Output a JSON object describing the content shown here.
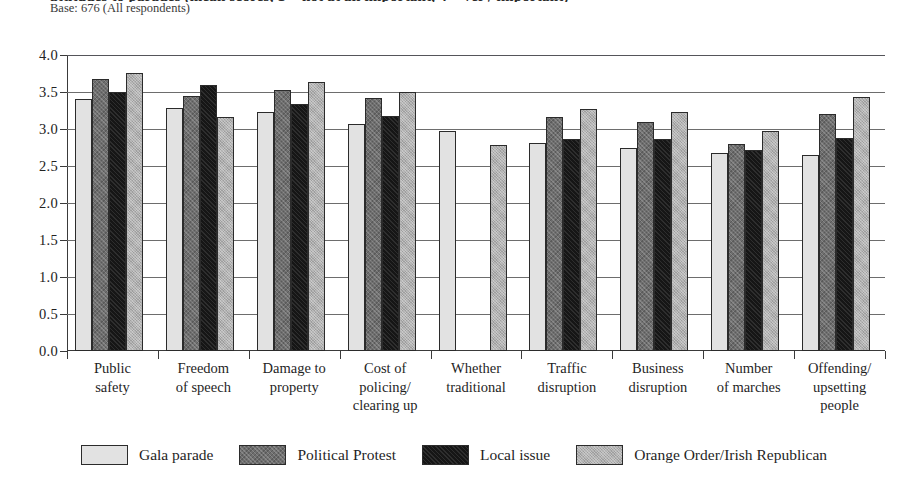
{
  "header": {
    "title_clipped": "attitudes to parades (mean scores, 1 = not at all important, 4 = very important)",
    "base_note": "Base: 676 (All respondents)"
  },
  "chart_data": {
    "type": "bar",
    "title": "",
    "xlabel": "",
    "ylabel": "",
    "ylim": [
      0.0,
      4.0
    ],
    "ytick_labels": [
      "4.0",
      "3.5",
      "3.0",
      "2.5",
      "2.0",
      "1.5",
      "1.0",
      "0.5",
      "0.0"
    ],
    "ytick_values": [
      4.0,
      3.5,
      3.0,
      2.5,
      2.0,
      1.5,
      1.0,
      0.5,
      0.0
    ],
    "grid": true,
    "legend_position": "bottom",
    "categories": [
      "Public safety",
      "Freedom of speech",
      "Damage to property",
      "Cost of policing/ clearing up",
      "Whether traditional",
      "Traffic disruption",
      "Business disruption",
      "Number of marches",
      "Offending/ upsetting people"
    ],
    "category_lines": [
      [
        "Public",
        "safety"
      ],
      [
        "Freedom",
        "of speech"
      ],
      [
        "Damage to",
        "property"
      ],
      [
        "Cost of",
        "policing/",
        "clearing up"
      ],
      [
        "Whether",
        "traditional"
      ],
      [
        "Traffic",
        "disruption"
      ],
      [
        "Business",
        "disruption"
      ],
      [
        "Number",
        "of marches"
      ],
      [
        "Offending/",
        "upsetting",
        "people"
      ]
    ],
    "series": [
      {
        "name": "Gala parade",
        "color": "#e2e2e2",
        "values": [
          3.41,
          3.29,
          3.23,
          3.07,
          2.97,
          2.81,
          2.75,
          2.68,
          2.65
        ]
      },
      {
        "name": "Political Protest",
        "color": "#6e6e6e",
        "values": [
          3.68,
          3.44,
          3.53,
          3.42,
          null,
          3.16,
          3.1,
          2.8,
          3.2
        ]
      },
      {
        "name": "Local issue",
        "color": "#161616",
        "values": [
          3.5,
          3.6,
          3.34,
          3.18,
          null,
          2.87,
          2.87,
          2.72,
          2.88
        ]
      },
      {
        "name": "Orange Order/Irish Republican",
        "color": "#b0b0b0",
        "values": [
          3.76,
          3.16,
          3.63,
          3.5,
          2.78,
          3.27,
          3.23,
          2.97,
          3.43
        ]
      }
    ]
  }
}
